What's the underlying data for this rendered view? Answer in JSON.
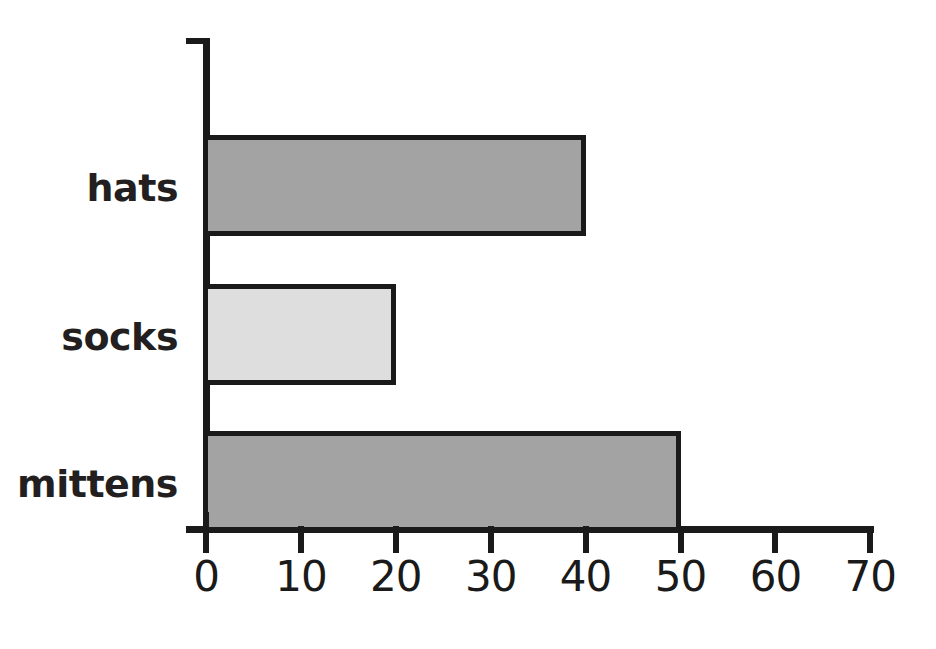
{
  "chart_data": {
    "type": "bar",
    "orientation": "horizontal",
    "title": "",
    "xlabel": "",
    "ylabel": "",
    "categories": [
      "hats",
      "socks",
      "mittens"
    ],
    "values": [
      40,
      20,
      50
    ],
    "series": [
      {
        "name": "count",
        "values": [
          40,
          20,
          50
        ]
      }
    ],
    "xlim": [
      0,
      70
    ],
    "ylim": null,
    "x_ticks": [
      0,
      10,
      20,
      30,
      40,
      50,
      60,
      70
    ],
    "x_tick_labels": [
      "0",
      "10",
      "20",
      "30",
      "40",
      "50",
      "60",
      "70"
    ],
    "grid": false,
    "legend": false,
    "legend_position": "none",
    "bar_colors": [
      "#a3a3a3",
      "#dedede",
      "#a3a3a3"
    ],
    "bar_edge_color": "#1a1a1a",
    "background_color": "#ffffff",
    "axis_color": "#1a1a1a",
    "bars": [
      {
        "label": "hats",
        "value": 40,
        "fill": "#a3a3a3"
      },
      {
        "label": "socks",
        "value": 20,
        "fill": "#dedede"
      },
      {
        "label": "mittens",
        "value": 50,
        "fill": "#a3a3a3"
      }
    ]
  },
  "geometry": {
    "x0_px": 206,
    "px_per_unit": 9.49,
    "bar_rows": [
      {
        "top": 135,
        "height": 101
      },
      {
        "top": 284,
        "height": 101
      },
      {
        "top": 431,
        "height": 101
      }
    ]
  }
}
